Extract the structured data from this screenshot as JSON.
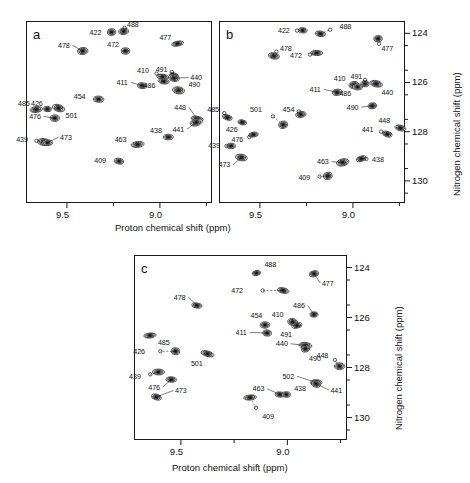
{
  "figure": {
    "type": "nmr-hsqc-contour-figure",
    "panel_count": 3,
    "xlabel": "Proton chemical shift (ppm)",
    "ylabel": "Nitrogen chemical shift (ppm)",
    "xticklabels": [
      "9.5",
      "9.0"
    ],
    "yticklabels": [
      "124",
      "126",
      "128",
      "130"
    ],
    "xlim": [
      9.72,
      8.72
    ],
    "ylim": [
      123.5,
      130.9
    ],
    "xmajor": [
      9.5,
      9.0
    ],
    "xminor": [
      9.75,
      9.25,
      8.75
    ],
    "ymajor": [
      124,
      126,
      128,
      130
    ],
    "yminor": [
      124.5,
      125.5,
      126.5,
      127.5,
      128.5,
      129.5,
      130.5
    ],
    "contour_color": "#1c1c1c",
    "fill_color": "#6e6e6e"
  },
  "chart_data": {
    "type": "scatter",
    "title": "",
    "xlabel": "Proton chemical shift (ppm)",
    "ylabel": "Nitrogen chemical shift (ppm)",
    "xlim": [
      9.72,
      8.72
    ],
    "ylim": [
      130.9,
      123.5
    ],
    "grid": false,
    "legend": "none",
    "panels": [
      {
        "id": "a",
        "label": "a",
        "peaks": [
          {
            "label": "422",
            "x": 9.26,
            "y": 123.95,
            "lx": 9.3,
            "ly": 123.95,
            "marker": false
          },
          {
            "label": "488",
            "x": 9.195,
            "y": 123.92,
            "lx": 9.185,
            "ly": 123.66,
            "marker": true
          },
          {
            "label": "477",
            "x": 8.905,
            "y": 124.42,
            "lx": 8.925,
            "ly": 124.17,
            "marker": false
          },
          {
            "label": "478",
            "x": 9.415,
            "y": 124.72,
            "lx": 9.47,
            "ly": 124.49,
            "marker": false
          },
          {
            "label": "472",
            "x": 9.185,
            "y": 124.72,
            "lx": 9.205,
            "ly": 124.47,
            "marker": false
          },
          {
            "label": "410",
            "x": 8.985,
            "y": 125.77,
            "lx": 9.045,
            "ly": 125.53,
            "marker": true
          },
          {
            "label": "491",
            "x": 8.925,
            "y": 125.72,
            "lx": 8.945,
            "ly": 125.45,
            "marker": true
          },
          {
            "label": "440",
            "x": 8.925,
            "y": 125.82,
            "lx": 8.845,
            "ly": 125.8,
            "marker": false
          },
          {
            "label": "486",
            "x": 8.98,
            "y": 125.95,
            "lx": 9.01,
            "ly": 126.13,
            "marker": false
          },
          {
            "label": "411",
            "x": 9.095,
            "y": 126.13,
            "lx": 9.155,
            "ly": 126.0,
            "marker": false
          },
          {
            "label": "490",
            "x": 8.9,
            "y": 126.32,
            "lx": 8.855,
            "ly": 126.1,
            "marker": false
          },
          {
            "label": "454",
            "x": 9.33,
            "y": 126.68,
            "lx": 9.385,
            "ly": 126.55,
            "marker": false
          },
          {
            "label": "485",
            "x": 9.665,
            "y": 127.1,
            "lx": 9.685,
            "ly": 126.86,
            "marker": false
          },
          {
            "label": "426",
            "x": 9.605,
            "y": 127.08,
            "lx": 9.615,
            "ly": 126.84,
            "marker": false
          },
          {
            "label": "501",
            "x": 9.545,
            "y": 127.04,
            "lx": 9.515,
            "ly": 127.32,
            "marker": false
          },
          {
            "label": "448",
            "x": 8.8,
            "y": 127.48,
            "lx": 8.845,
            "ly": 127.0,
            "marker": false
          },
          {
            "label": "476",
            "x": 9.565,
            "y": 127.45,
            "lx": 9.625,
            "ly": 127.38,
            "marker": false
          },
          {
            "label": "441",
            "x": 8.805,
            "y": 127.62,
            "lx": 8.855,
            "ly": 127.9,
            "marker": false
          },
          {
            "label": "438",
            "x": 8.955,
            "y": 128.22,
            "lx": 8.975,
            "ly": 127.93,
            "marker": false
          },
          {
            "label": "439",
            "x": 9.625,
            "y": 128.42,
            "lx": 9.695,
            "ly": 128.33,
            "marker": true
          },
          {
            "label": "473",
            "x": 9.605,
            "y": 128.45,
            "lx": 9.545,
            "ly": 128.22,
            "marker": false
          },
          {
            "label": "463",
            "x": 9.12,
            "y": 128.52,
            "lx": 9.165,
            "ly": 128.3,
            "marker": false
          },
          {
            "label": "409",
            "x": 9.22,
            "y": 129.2,
            "lx": 9.275,
            "ly": 129.15,
            "marker": false
          }
        ]
      },
      {
        "id": "b",
        "label": "b",
        "peaks": [
          {
            "label": "422",
            "x": 9.27,
            "y": 123.88,
            "lx": 9.325,
            "ly": 123.9,
            "marker": true
          },
          {
            "label": "488",
            "x": 9.175,
            "y": 124.02,
            "lx": 9.08,
            "ly": 123.72,
            "marker": true
          },
          {
            "label": "477",
            "x": 8.865,
            "y": 124.22,
            "lx": 8.855,
            "ly": 124.6,
            "marker": true
          },
          {
            "label": "478",
            "x": 9.425,
            "y": 124.92,
            "lx": 9.4,
            "ly": 124.6,
            "marker": true
          },
          {
            "label": "472",
            "x": 9.195,
            "y": 124.8,
            "lx": 9.26,
            "ly": 124.92,
            "marker": true
          },
          {
            "label": "410",
            "x": 8.995,
            "y": 126.1,
            "lx": 9.025,
            "ly": 125.82,
            "marker": false
          },
          {
            "label": "491",
            "x": 8.935,
            "y": 126.05,
            "lx": 8.935,
            "ly": 125.76,
            "marker": true
          },
          {
            "label": "440",
            "x": 8.875,
            "y": 126.05,
            "lx": 8.855,
            "ly": 126.4,
            "marker": false
          },
          {
            "label": "486",
            "x": 8.975,
            "y": 126.18,
            "lx": 8.995,
            "ly": 126.45,
            "marker": false
          },
          {
            "label": "411",
            "x": 9.085,
            "y": 126.4,
            "lx": 9.155,
            "ly": 126.28,
            "marker": false
          },
          {
            "label": "490",
            "x": 8.895,
            "y": 126.95,
            "lx": 8.955,
            "ly": 127.0,
            "marker": false
          },
          {
            "label": "454",
            "x": 9.28,
            "y": 127.3,
            "lx": 9.3,
            "ly": 127.08,
            "marker": true
          },
          {
            "label": "485",
            "x": 9.675,
            "y": 127.42,
            "lx": 9.705,
            "ly": 127.1,
            "marker": true
          },
          {
            "label": "501",
            "x": 9.375,
            "y": 127.72,
            "lx": 9.475,
            "ly": 127.1,
            "marker": true
          },
          {
            "label": "426",
            "x": 9.595,
            "y": 127.62,
            "lx": 9.605,
            "ly": 127.9,
            "marker": false
          },
          {
            "label": "448",
            "x": 8.745,
            "y": 127.85,
            "lx": 8.785,
            "ly": 127.56,
            "marker": false
          },
          {
            "label": "441",
            "x": 8.815,
            "y": 128.1,
            "lx": 8.875,
            "ly": 127.92,
            "marker": true
          },
          {
            "label": "476",
            "x": 9.535,
            "y": 128.12,
            "lx": 9.575,
            "ly": 128.3,
            "marker": true
          },
          {
            "label": "439",
            "x": 9.655,
            "y": 128.58,
            "lx": 9.7,
            "ly": 128.58,
            "marker": true
          },
          {
            "label": "473",
            "x": 9.6,
            "y": 129.05,
            "lx": 9.645,
            "ly": 129.35,
            "marker": false
          },
          {
            "label": "438",
            "x": 8.955,
            "y": 129.1,
            "lx": 8.905,
            "ly": 129.12,
            "marker": true
          },
          {
            "label": "463",
            "x": 9.055,
            "y": 129.25,
            "lx": 9.115,
            "ly": 129.22,
            "marker": false
          },
          {
            "label": "409",
            "x": 9.135,
            "y": 129.8,
            "lx": 9.215,
            "ly": 129.85,
            "marker": true
          }
        ]
      },
      {
        "id": "c",
        "label": "c",
        "peaks": [
          {
            "label": "488",
            "x": 9.145,
            "y": 124.22,
            "lx": 9.115,
            "ly": 123.88,
            "marker": false
          },
          {
            "label": "477",
            "x": 8.875,
            "y": 124.25,
            "lx": 8.845,
            "ly": 124.62,
            "marker": false
          },
          {
            "label": "472",
            "x": 9.02,
            "y": 124.92,
            "lx": 9.195,
            "ly": 124.92,
            "marker": true
          },
          {
            "label": "478",
            "x": 9.425,
            "y": 125.52,
            "lx": 9.465,
            "ly": 125.18,
            "marker": false
          },
          {
            "label": "486",
            "x": 8.875,
            "y": 125.88,
            "lx": 8.905,
            "ly": 125.52,
            "marker": false
          },
          {
            "label": "410",
            "x": 8.975,
            "y": 126.18,
            "lx": 9.005,
            "ly": 125.86,
            "marker": false
          },
          {
            "label": "454",
            "x": 9.105,
            "y": 126.3,
            "lx": 9.105,
            "ly": 125.92,
            "marker": false
          },
          {
            "label": "491",
            "x": 8.955,
            "y": 126.32,
            "lx": 8.965,
            "ly": 126.68,
            "marker": false
          },
          {
            "label": "411",
            "x": 9.095,
            "y": 126.62,
            "lx": 9.175,
            "ly": 126.6,
            "marker": false
          },
          {
            "label": "485",
            "x": 9.645,
            "y": 126.72,
            "lx": 9.615,
            "ly": 127.0,
            "marker": false
          },
          {
            "label": "440",
            "x": 8.915,
            "y": 127.12,
            "lx": 8.985,
            "ly": 127.05,
            "marker": false
          },
          {
            "label": "426",
            "x": 9.525,
            "y": 127.35,
            "lx": 9.655,
            "ly": 127.35,
            "marker": true
          },
          {
            "label": "501",
            "x": 9.375,
            "y": 127.45,
            "lx": 9.385,
            "ly": 127.82,
            "marker": false
          },
          {
            "label": "490",
            "x": 8.915,
            "y": 127.25,
            "lx": 8.905,
            "ly": 127.62,
            "marker": false
          },
          {
            "label": "448",
            "x": 8.755,
            "y": 127.95,
            "lx": 8.795,
            "ly": 127.5,
            "marker": true
          },
          {
            "label": "439",
            "x": 9.605,
            "y": 128.18,
            "lx": 9.675,
            "ly": 128.35,
            "marker": true
          },
          {
            "label": "502",
            "x": 8.865,
            "y": 128.6,
            "lx": 8.955,
            "ly": 128.35,
            "marker": false
          },
          {
            "label": "476",
            "x": 9.545,
            "y": 128.48,
            "lx": 9.585,
            "ly": 128.78,
            "marker": false
          },
          {
            "label": "441",
            "x": 8.865,
            "y": 128.65,
            "lx": 8.805,
            "ly": 128.9,
            "marker": false
          },
          {
            "label": "473",
            "x": 9.615,
            "y": 129.18,
            "lx": 9.535,
            "ly": 128.92,
            "marker": false
          },
          {
            "label": "463",
            "x": 9.035,
            "y": 129.08,
            "lx": 9.095,
            "ly": 128.85,
            "marker": false
          },
          {
            "label": "438",
            "x": 9.005,
            "y": 129.08,
            "lx": 8.975,
            "ly": 128.85,
            "marker": false
          },
          {
            "label": "409",
            "x": 9.175,
            "y": 129.2,
            "lx": 9.125,
            "ly": 129.95,
            "marker": true
          }
        ]
      }
    ]
  }
}
